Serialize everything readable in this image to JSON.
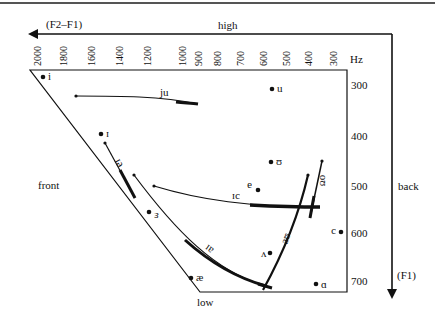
{
  "labels": {
    "x_axis_name": "(F2–F1)",
    "x_axis_direction": "high",
    "hz_unit": "Hz",
    "front": "front",
    "back": "back",
    "low": "low",
    "y_axis_name": "(F1)"
  },
  "x_ticks": [
    "2000",
    "1800",
    "1600",
    "1400",
    "1200",
    "1000",
    "900",
    "800",
    "700",
    "600",
    "500",
    "400",
    "300"
  ],
  "y_ticks": [
    "300",
    "400",
    "500",
    "600",
    "700"
  ],
  "vowels": [
    {
      "symbol": "i",
      "f2f1": 2000,
      "f1": 280
    },
    {
      "symbol": "u",
      "f2f1": 600,
      "f1": 300
    },
    {
      "symbol": "ɪ",
      "f2f1": 1700,
      "f1": 390
    },
    {
      "symbol": "ʊ",
      "f2f1": 600,
      "f1": 450
    },
    {
      "symbol": "ə",
      "f2f1": 750,
      "f1": 505
    },
    {
      "symbol": "ɛ",
      "f2f1": 1250,
      "f1": 550
    },
    {
      "symbol": "ɔ",
      "f2f1": 280,
      "f1": 590
    },
    {
      "symbol": "ʌ",
      "f2f1": 650,
      "f1": 640
    },
    {
      "symbol": "æ",
      "f2f1": 1100,
      "f1": 690
    },
    {
      "symbol": "ɑ",
      "f2f1": 400,
      "f1": 700
    }
  ],
  "diphthongs": [
    {
      "label": "ju",
      "from": "~950 Hz / 335",
      "to": "~1820 Hz / 320"
    },
    {
      "label": "eɪ",
      "from": "~1550 Hz / 525",
      "to": "~1700 Hz / 410"
    },
    {
      "label": "ɔɪ",
      "from": "~400 Hz / 540",
      "to": "~1500 Hz / 500"
    },
    {
      "label": "aɪ",
      "from": "~600 Hz / 710",
      "to": "~1550 Hz / 470"
    },
    {
      "label": "aʊ",
      "from": "~600 Hz / 710",
      "to": "~430 Hz / 480"
    },
    {
      "label": "oʊ",
      "from": "~430 Hz / 570",
      "to": "~390 Hz / 450"
    }
  ]
}
